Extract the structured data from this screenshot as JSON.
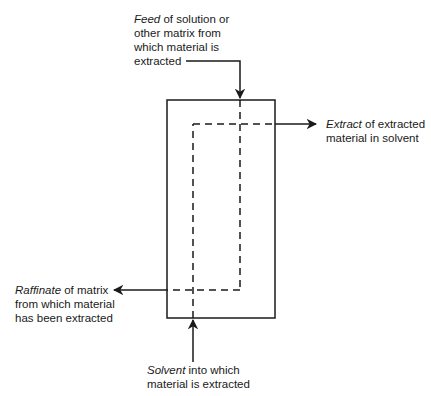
{
  "diagram": {
    "type": "liquid-liquid extraction schematic",
    "labels": {
      "feed": {
        "term": "Feed",
        "lines": [
          " of solution or",
          "other matrix from",
          "which material is",
          "extracted"
        ]
      },
      "extract": {
        "term": "Extract",
        "lines": [
          " of extracted",
          "material in solvent"
        ]
      },
      "raffinate": {
        "term": "Raffinate",
        "lines": [
          " of matrix",
          "from which material",
          "has been extracted"
        ]
      },
      "solvent": {
        "term": "Solvent",
        "lines": [
          " into which",
          "material is extracted"
        ]
      }
    },
    "colors": {
      "stroke": "#1a1a1a",
      "background": "#ffffff"
    }
  }
}
